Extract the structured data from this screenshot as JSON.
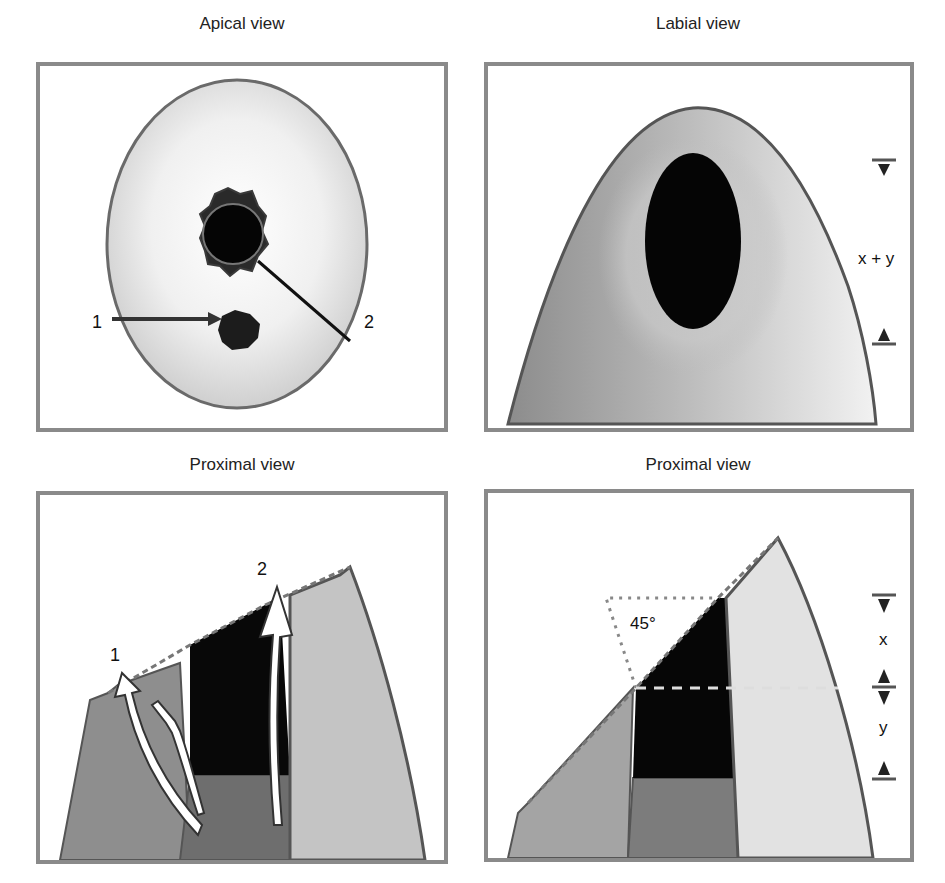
{
  "figure": {
    "panels": [
      {
        "title": "Apical view",
        "labels": {
          "pointer_1": "1",
          "pointer_2": "2"
        }
      },
      {
        "title": "Labial view",
        "labels": {
          "dimension": "x + y"
        }
      },
      {
        "title": "Proximal view",
        "labels": {
          "arrow_1": "1",
          "arrow_2": "2"
        }
      },
      {
        "title": "Proximal view",
        "labels": {
          "angle": "45°",
          "dimension_x": "x",
          "dimension_y": "y"
        }
      }
    ]
  },
  "colors": {
    "frame": "#8a8a8a",
    "outline": "#5a5a5a",
    "light_fill": "#e6e6e6",
    "mid_fill": "#a8a8a8",
    "dark_fill": "#7a7a7a",
    "lesion": "#0a0a0a"
  }
}
